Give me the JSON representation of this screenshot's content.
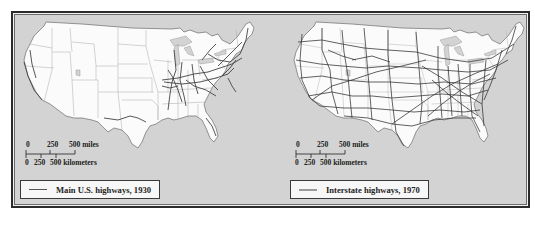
{
  "figure": {
    "background_color": "#d3d3d3",
    "land_color": "#fbfbfb",
    "border_color": "#2b2b2b"
  },
  "maps": [
    {
      "id": "left",
      "subject": "Main U.S. highways, 1930",
      "highway_color": "#444444",
      "scale": {
        "miles_ticks": [
          "0",
          "250",
          "500 miles"
        ],
        "km_ticks": [
          "0",
          "250",
          "500 kilometers"
        ]
      },
      "legend": {
        "label": "Main U.S. highways, 1930",
        "swatch_color": "#555555"
      }
    },
    {
      "id": "right",
      "subject": "Interstate highways, 1970",
      "highway_color": "#3a3a3a",
      "scale": {
        "miles_ticks": [
          "0",
          "250",
          "500 miles"
        ],
        "km_ticks": [
          "0",
          "250",
          "500 kilometers"
        ]
      },
      "legend": {
        "label": "Interstate highways, 1970",
        "swatch_color": "#9a9a9a"
      }
    }
  ]
}
